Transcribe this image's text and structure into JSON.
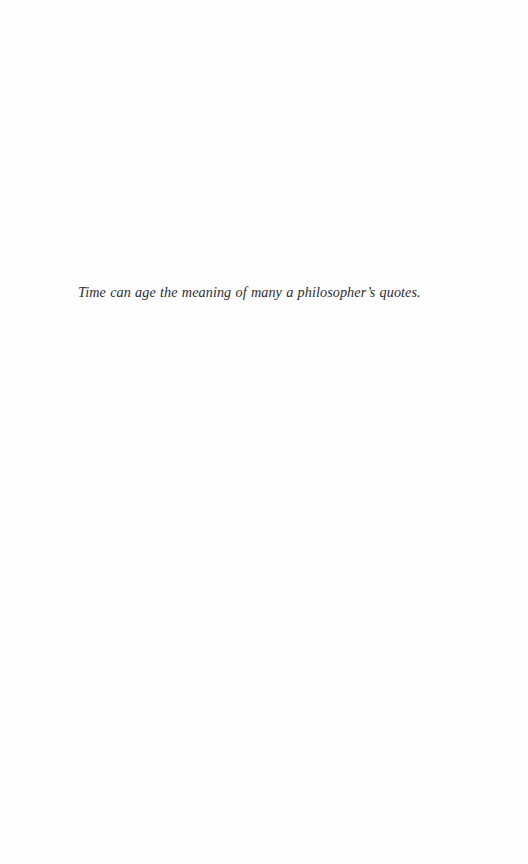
{
  "page": {
    "kind": "scanned-book-page",
    "background_color": "#fefefe",
    "width": 528,
    "height": 864
  },
  "content": {
    "epigraph": {
      "text": "Time can age the meaning of many a philosopher’s quotes.",
      "style": "italic",
      "alignment": "left",
      "text_color": "#2c2c2e"
    }
  }
}
